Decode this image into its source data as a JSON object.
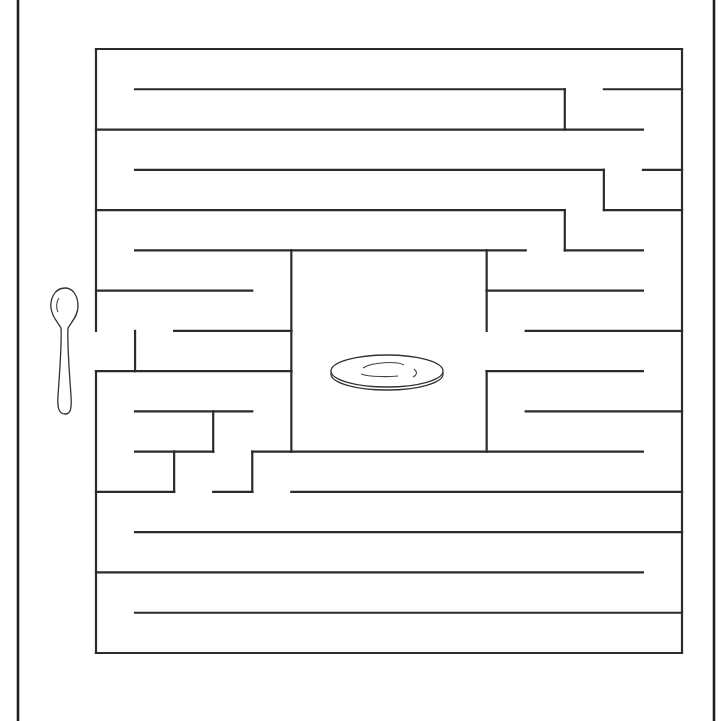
{
  "puzzle": {
    "type": "maze",
    "start_item": "spoon",
    "goal_item": "plate",
    "colors": {
      "wall": "#2b2b2b",
      "background": "#ffffff"
    },
    "grid": {
      "columns": 15,
      "rows": 15
    },
    "walls_grid_units": {
      "note": "grid-cell coordinates: column index 0..15 left-to-right, row index 0..15 top-to-bottom",
      "horizontal": [
        [
          0,
          0,
          15
        ],
        [
          1,
          1,
          12
        ],
        [
          1,
          13,
          15
        ],
        [
          2,
          0,
          14
        ],
        [
          3,
          1,
          13
        ],
        [
          3,
          14,
          15
        ],
        [
          4,
          0,
          12
        ],
        [
          4,
          13,
          15
        ],
        [
          5,
          1,
          11
        ],
        [
          5,
          12,
          14
        ],
        [
          6,
          0,
          4
        ],
        [
          6,
          10,
          14
        ],
        [
          7,
          2,
          5
        ],
        [
          7,
          11,
          15
        ],
        [
          8,
          0,
          5
        ],
        [
          8,
          10,
          14
        ],
        [
          9,
          1,
          4
        ],
        [
          9,
          11,
          15
        ],
        [
          10,
          1,
          3
        ],
        [
          10,
          4,
          14
        ],
        [
          11,
          0,
          2
        ],
        [
          11,
          3,
          4
        ],
        [
          11,
          5,
          15
        ],
        [
          12,
          1,
          15
        ],
        [
          13,
          0,
          14
        ],
        [
          14,
          1,
          15
        ],
        [
          15,
          0,
          15
        ]
      ],
      "vertical": [
        [
          0,
          0,
          7
        ],
        [
          0,
          8,
          15
        ],
        [
          1,
          7,
          8
        ],
        [
          2,
          10,
          11
        ],
        [
          3,
          9,
          10
        ],
        [
          4,
          10,
          11
        ],
        [
          5,
          5,
          10
        ],
        [
          10,
          5,
          7
        ],
        [
          10,
          8,
          10
        ],
        [
          12,
          1,
          2
        ],
        [
          12,
          4,
          5
        ],
        [
          13,
          3,
          4
        ],
        [
          15,
          0,
          15
        ]
      ]
    }
  }
}
